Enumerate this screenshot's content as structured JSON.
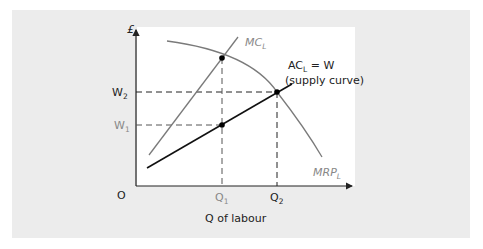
{
  "diagram": {
    "type": "economics-labour-market-monopsony",
    "axes": {
      "y_label": "£",
      "origin_label": "O",
      "x_title": "Q of labour"
    },
    "curves": [
      {
        "id": "mrp",
        "label": "MRP",
        "subscript": "L",
        "color": "#7a7a7a"
      },
      {
        "id": "mc",
        "label": "MC",
        "subscript": "L",
        "color": "#7a7a7a"
      },
      {
        "id": "ac",
        "label": "AC",
        "subscript": "L",
        "label_suffix": " = W",
        "note": "(supply curve)",
        "color": "#111111"
      }
    ],
    "y_ticks": [
      {
        "label": "W",
        "subscript": "2",
        "color": "#222222"
      },
      {
        "label": "W",
        "subscript": "1",
        "color": "#888888"
      }
    ],
    "x_ticks": [
      {
        "label": "Q",
        "subscript": "1",
        "color": "#888888"
      },
      {
        "label": "Q",
        "subscript": "2",
        "color": "#222222"
      }
    ],
    "points": [
      {
        "name": "MC-MRP intersection at Q1"
      },
      {
        "name": "AC-MRP intersection at Q2, W2"
      },
      {
        "name": "AC at Q1, W1"
      }
    ],
    "colors": {
      "panel_bg": "#ececec",
      "plot_bg": "#ffffff",
      "axis": "#222222",
      "gray_curve": "#7a7a7a",
      "black_curve": "#111111"
    }
  }
}
